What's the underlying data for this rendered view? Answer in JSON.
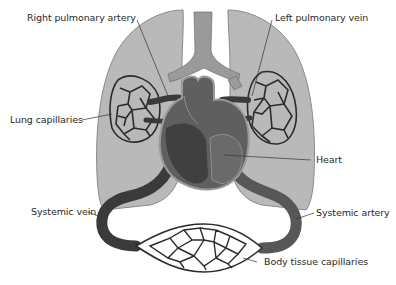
{
  "diagram": {
    "labels": {
      "right_pulmonary_artery": "Right pulmonary artery",
      "left_pulmonary_vein": "Left pulmonary vein",
      "lung_capillaries": "Lung capillaries",
      "heart": "Heart",
      "systemic_vein": "Systemic vein",
      "systemic_artery": "Systemic artery",
      "body_tissue_capillaries": "Body tissue capillaries"
    },
    "colors": {
      "background": "#ffffff",
      "lung_fill": "#b9b9b9",
      "lung_edge": "#8a8a8a",
      "trachea": "#9a9a9a",
      "vessel_dark": "#3a3a3a",
      "vessel_mid": "#575757",
      "heart_dark": "#404040",
      "heart_mid": "#5f5f5f",
      "capillary_line": "#2b2b2b",
      "leader_line": "#333333",
      "text": "#2a2a2a"
    }
  }
}
